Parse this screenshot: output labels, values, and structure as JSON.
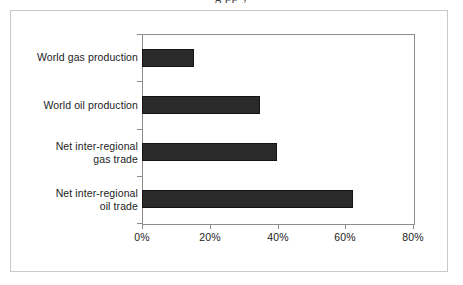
{
  "figure": {
    "cropped_top_text": "g                                                                                                    pp y",
    "frame_color": "#c9c9c9",
    "background": "#ffffff"
  },
  "chart_data": {
    "type": "bar",
    "orientation": "horizontal",
    "title": "",
    "subtitle": "",
    "xlabel": "",
    "ylabel": "",
    "categories": [
      "World gas production",
      "World oil production",
      "Net inter-regional\ngas trade",
      "Net inter-regional\noil trade"
    ],
    "category_lines": [
      [
        "World gas production"
      ],
      [
        "World oil production"
      ],
      [
        "Net inter-regional",
        "gas trade"
      ],
      [
        "Net inter-regional",
        "oil trade"
      ]
    ],
    "values": [
      15.3,
      34.8,
      39.8,
      62.2
    ],
    "value_labels": [
      "15%",
      "35%",
      "40%",
      "62%"
    ],
    "xlim": [
      0,
      80
    ],
    "xticks": [
      0,
      20,
      40,
      60,
      80
    ],
    "xtick_labels": [
      "0%",
      "20%",
      "40%",
      "60%",
      "80%"
    ],
    "grid": false,
    "legend": null,
    "series": [
      {
        "name": "Share",
        "values": [
          15.3,
          34.8,
          39.8,
          62.2
        ],
        "color": "#2b2b2b"
      }
    ],
    "bar_color": "#2b2b2b",
    "bar_edge_color": "#141414",
    "axis_color": "#8d8d8d"
  }
}
